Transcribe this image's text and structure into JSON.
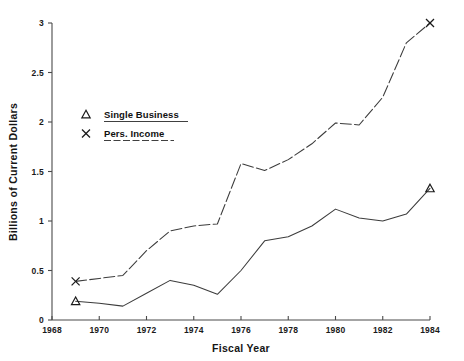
{
  "chart_data": {
    "type": "line",
    "title": "",
    "xlabel": "Fiscal Year",
    "ylabel": "Billions of Current Dollars",
    "xlim": [
      1968,
      1984
    ],
    "ylim": [
      0,
      3
    ],
    "grid": false,
    "legend_position": "upper-left-inside",
    "x": [
      1969,
      1970,
      1971,
      1972,
      1973,
      1974,
      1975,
      1976,
      1977,
      1978,
      1979,
      1980,
      1981,
      1982,
      1983,
      1984
    ],
    "xticks": [
      1968,
      1970,
      1972,
      1974,
      1976,
      1978,
      1980,
      1982,
      1984
    ],
    "xticklabels": [
      "1968",
      "1970",
      "1972",
      "1974",
      "1976",
      "1978",
      "1980",
      "1982",
      "1984"
    ],
    "yticks": [
      0,
      0.5,
      1,
      1.5,
      2,
      2.5,
      3
    ],
    "yticklabels": [
      "0",
      "0.5",
      "1",
      "1.5",
      "2",
      "2.5",
      "3"
    ],
    "series": [
      {
        "name": "Single Business",
        "marker": "triangle",
        "linestyle": "solid",
        "marker_points": [
          1969,
          1984
        ],
        "values": [
          0.19,
          0.17,
          0.14,
          0.27,
          0.4,
          0.35,
          0.26,
          0.5,
          0.8,
          0.84,
          0.95,
          1.12,
          1.03,
          1.0,
          1.07,
          1.33
        ]
      },
      {
        "name": "Pers. Income",
        "marker": "x",
        "linestyle": "dashed",
        "marker_points": [
          1969,
          1984
        ],
        "values": [
          0.39,
          0.42,
          0.45,
          0.7,
          0.9,
          0.95,
          0.97,
          1.58,
          1.51,
          1.62,
          1.78,
          1.99,
          1.97,
          2.25,
          2.8,
          3.0
        ]
      }
    ]
  },
  "legend": {
    "items": [
      {
        "symbol": "triangle",
        "label": "Single Business"
      },
      {
        "symbol": "x",
        "label": "Pers. Income"
      }
    ]
  },
  "colors": {
    "axis": "#4a4a4a",
    "line": "#3c3c3c",
    "text": "#1a1a1a",
    "background": "#ffffff"
  }
}
